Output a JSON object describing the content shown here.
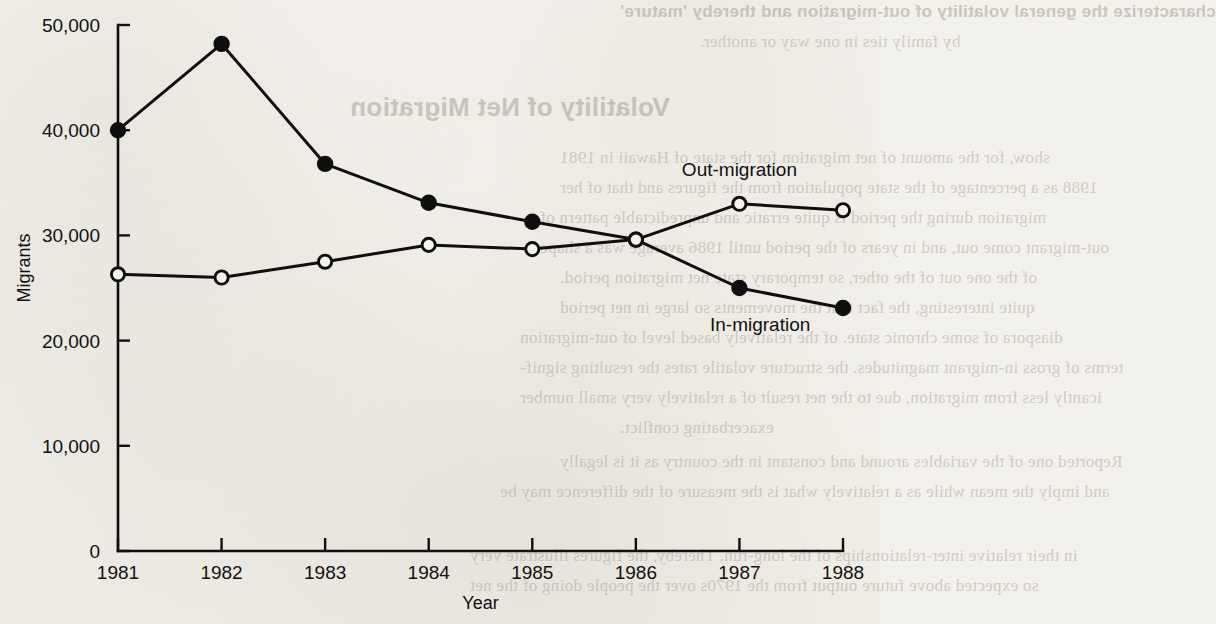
{
  "chart_data": {
    "type": "line",
    "title": "",
    "xlabel": "Year",
    "ylabel": "Migrants",
    "categories": [
      "1981",
      "1982",
      "1983",
      "1984",
      "1985",
      "1986",
      "1987",
      "1988"
    ],
    "x": [
      1981,
      1982,
      1983,
      1984,
      1985,
      1986,
      1987,
      1988
    ],
    "xlim": [
      1981,
      1988
    ],
    "ylim": [
      0,
      50000
    ],
    "yticks": [
      0,
      10000,
      20000,
      30000,
      40000,
      50000
    ],
    "ytick_labels": [
      "0",
      "10,000",
      "20,000",
      "30,000",
      "40,000",
      "50,000"
    ],
    "xticks": [
      1981,
      1982,
      1983,
      1984,
      1985,
      1986,
      1987,
      1988
    ],
    "xtick_labels": [
      "1981",
      "1982",
      "1983",
      "1984",
      "1985",
      "1986",
      "1987",
      "1988"
    ],
    "grid": false,
    "legend_position": "inline-annotation",
    "series": [
      {
        "name": "In-migration",
        "marker": "filled-circle",
        "color": "#0f0f0f",
        "values": [
          40000,
          48200,
          36800,
          33100,
          31300,
          29600,
          25000,
          23100
        ]
      },
      {
        "name": "Out-migration",
        "marker": "open-circle",
        "color": "#0f0f0f",
        "values": [
          26300,
          26000,
          27500,
          29100,
          28700,
          29600,
          33000,
          32400
        ]
      }
    ],
    "annotations": [
      {
        "text": "Out-migration",
        "x": 1987.0,
        "y": 35600
      },
      {
        "text": "In-migration",
        "x": 1987.2,
        "y": 20900
      }
    ]
  },
  "page": {
    "background_color": "#f3f1ec",
    "ink_color": "#0f0f0f"
  },
  "bleed_through": {
    "lines": [
      "characterize the general volatility of out-migration and thereby 'mature'",
      "by family ties in one way or another.",
      "Volatility of Net Migration",
      "show, for the amount of net migration for the state of Hawaii in 1981",
      "1988 as a percentage of the state population from the figures and that of her",
      "migration during the period is quite erratic and unpredictable pattern of",
      "out-migrant come out, and in years of the period until 1986 average was a shape",
      "of the one out of the other, so temporary state net migration period.",
      "quite interesting, the fact that the movements so large in net period",
      "diaspora of some chronic state. of the relatively based level of out-migration",
      "terms of gross in-migrant magnitudes. the structure volatile rates the resulting signif-",
      "icantly less from migration, due to the net result of a relatively very small number",
      "exacerbating conflict.",
      "Reported one of the variables around and constant in the country as it is legally",
      "and imply the mean while as a relatively what is the measure of the difference may be",
      "in their relative inter-relationships of the long-run. Thereby, the figures illustrate very",
      "so expected above future output from the 1970s over the people doing of the net"
    ]
  }
}
